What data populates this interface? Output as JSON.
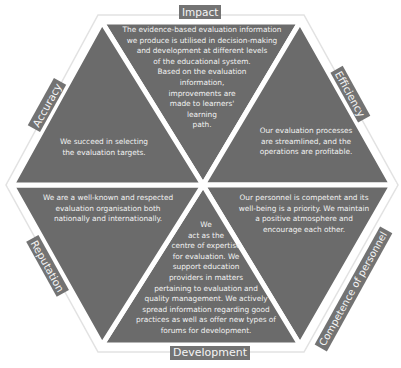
{
  "diagram": {
    "colors": {
      "segment_fill": "#6b6b6b",
      "label_fill": "#737373",
      "text": "#f2f2f2",
      "outline": "#e2e2e2",
      "gap": "#ffffff"
    },
    "segments": [
      {
        "id": "impact",
        "label": "Impact",
        "text": "The evidence-based evaluation information\nwe produce is utilised in decision-making\nand development at different levels\nof the educational system.\nBased on the evaluation\ninformation,\nimprovements are\nmade to learners'\nlearning\npath."
      },
      {
        "id": "efficiency",
        "label": "Efficiency",
        "text": "Our evaluation processes\nare streamlined, and the\noperations are profitable."
      },
      {
        "id": "competence-of-personnel",
        "label": "Competence of personnel",
        "text": "Our personnel is competent and its\nwell-being is a priority. We maintain\na positive atmosphere and\nencourage each other."
      },
      {
        "id": "development",
        "label": "Development",
        "text": "We\nact as the\ncentre of expertise\nfor evaluation. We\nsupport education\nproviders in matters\npertaining to evaluation and\nquality management. We actively\nspread information regarding good\npractices as well as offer new types of\nforums for development."
      },
      {
        "id": "reputation",
        "label": "Reputation",
        "text": "We are a well-known and respected\nevaluation organisation both\nnationally and internationally."
      },
      {
        "id": "accuracy",
        "label": "Accuracy",
        "text": "We succeed in selecting\nthe evaluation targets."
      }
    ]
  }
}
